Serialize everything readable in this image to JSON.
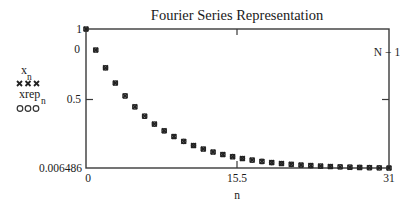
{
  "chart_data": {
    "type": "scatter",
    "title": "Fourier Series Representation",
    "xlabel": "n",
    "ylabel": "",
    "xlim": [
      0,
      31
    ],
    "ylim": [
      0.006486,
      1
    ],
    "grid": false,
    "legend_position": "left",
    "x_tick_labels": {
      "min": "0",
      "mid": "15.5",
      "max": "31"
    },
    "y_tick_labels": {
      "max": "1",
      "marker": "0",
      "mid": "0.5",
      "min": "0.006486"
    },
    "x_marker_label": "N − 1",
    "legend": [
      {
        "name": "x",
        "subscript": "n",
        "symbol": "×××"
      },
      {
        "name": "xrep",
        "subscript": "n",
        "symbol": "ooo"
      }
    ],
    "x": [
      0,
      1,
      2,
      3,
      4,
      5,
      6,
      7,
      8,
      9,
      10,
      11,
      12,
      13,
      14,
      15,
      16,
      17,
      18,
      19,
      20,
      21,
      22,
      23,
      24,
      25,
      26,
      27,
      28,
      29,
      30,
      31
    ],
    "series": [
      {
        "name": "x_n",
        "marker": "x",
        "values": [
          1.0,
          0.85,
          0.7225,
          0.6141,
          0.522,
          0.4437,
          0.3771,
          0.3206,
          0.2725,
          0.2316,
          0.1969,
          0.1673,
          0.1422,
          0.1209,
          0.1028,
          0.0874,
          0.0743,
          0.0631,
          0.0536,
          0.0456,
          0.0388,
          0.0329,
          0.028,
          0.0238,
          0.0202,
          0.0172,
          0.0146,
          0.0124,
          0.0106,
          0.009,
          0.0076,
          0.0065
        ]
      },
      {
        "name": "xrep_n",
        "marker": "o",
        "values": [
          1.0,
          0.85,
          0.7225,
          0.6141,
          0.522,
          0.4437,
          0.3771,
          0.3206,
          0.2725,
          0.2316,
          0.1969,
          0.1673,
          0.1422,
          0.1209,
          0.1028,
          0.0874,
          0.0743,
          0.0631,
          0.0536,
          0.0456,
          0.0388,
          0.0329,
          0.028,
          0.0238,
          0.0202,
          0.0172,
          0.0146,
          0.0124,
          0.0106,
          0.009,
          0.0076,
          0.0065
        ]
      }
    ]
  }
}
